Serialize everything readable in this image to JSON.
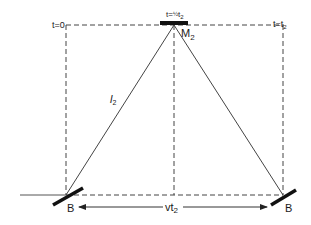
{
  "diagram": {
    "labels": {
      "t0": "t=0",
      "t_half_prefix": "t=",
      "t_half_frac": "½",
      "t_half_var": "t",
      "t_half_sub": "2",
      "t_end_prefix": "t=t",
      "t_end_sub": "2",
      "mirror_top": "M",
      "mirror_top_sub": "2",
      "path_length": "l",
      "path_length_sub": "2",
      "splitter_left": "B",
      "splitter_right": "B",
      "distance": "vt",
      "distance_sub": "2"
    },
    "colors": {
      "line": "#333333",
      "mirror": "#111111",
      "text": "#1a1a1a"
    }
  }
}
